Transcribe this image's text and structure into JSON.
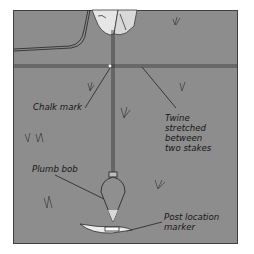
{
  "diagram": {
    "background_color": "#8d8d8d",
    "line_color": "#2a2a2a",
    "labels": {
      "chalk_mark": "Chalk mark",
      "twine_line1": "Twine",
      "twine_line2": "stretched",
      "twine_line3": "between",
      "twine_line4": "two stakes",
      "plumb_bob": "Plumb bob",
      "post_line1": "Post location",
      "post_line2": "marker"
    },
    "elements": [
      "hand",
      "twine",
      "chalk-mark",
      "plumb-line",
      "plumb-bob",
      "post-location-marker",
      "grass-tufts",
      "hose-line"
    ]
  }
}
